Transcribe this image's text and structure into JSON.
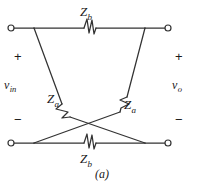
{
  "figure": {
    "caption": "(a)",
    "stroke_color": "#333333",
    "text_color": "#1a1a1a",
    "background": "#ffffff"
  },
  "labels": {
    "z_b_top": "Z",
    "z_b_top_sub": "b",
    "z_b_bottom": "Z",
    "z_b_bottom_sub": "b",
    "z_a_left": "Z",
    "z_a_left_sub": "a",
    "z_a_right": "Z",
    "z_a_right_sub": "a",
    "v_in": "v",
    "v_in_sub": "in",
    "v_o": "v",
    "v_o_sub": "o",
    "plus_left": "+",
    "minus_left": "−",
    "plus_right": "+",
    "minus_right": "−"
  },
  "terminals": [
    {
      "name": "input-positive",
      "x": 11,
      "y": 28
    },
    {
      "name": "output-positive",
      "x": 168,
      "y": 28
    },
    {
      "name": "input-negative",
      "x": 11,
      "y": 143
    },
    {
      "name": "output-negative",
      "x": 168,
      "y": 143
    }
  ],
  "nodes": {
    "top_left": {
      "x": 34,
      "y": 28
    },
    "top_right": {
      "x": 145,
      "y": 28
    },
    "bottom_left": {
      "x": 34,
      "y": 143
    },
    "bottom_right": {
      "x": 145,
      "y": 143
    },
    "center": {
      "x": 90,
      "y": 85
    }
  },
  "branches": [
    {
      "name": "z-b-top",
      "impedance": "Zb",
      "from": "top_left",
      "to": "top_right"
    },
    {
      "name": "z-b-bottom",
      "impedance": "Zb",
      "from": "bottom_left",
      "to": "bottom_right"
    },
    {
      "name": "z-a-left",
      "impedance": "Za",
      "from": "top_left",
      "to": "bottom_right"
    },
    {
      "name": "z-a-right",
      "impedance": "Za",
      "from": "top_right",
      "to": "bottom_left"
    }
  ]
}
